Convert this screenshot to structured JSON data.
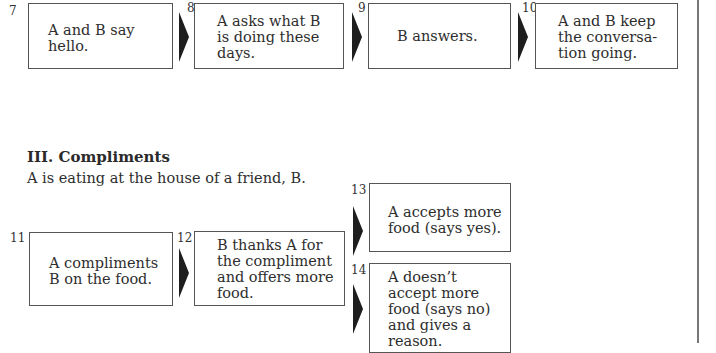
{
  "flow_row_1": {
    "steps": [
      {
        "number": "7",
        "text": "A and B say hello."
      },
      {
        "number": "8",
        "text": "A asks what B is doing these days."
      },
      {
        "number": "9",
        "text": "B answers."
      },
      {
        "number": "10",
        "text": "A and B keep the conversa- tion going."
      }
    ]
  },
  "section": {
    "heading": "III. Compliments",
    "intro": "A is eating at the house of a friend, B."
  },
  "flow_row_2": {
    "steps": [
      {
        "number": "11",
        "text": "A compliments B on the food."
      },
      {
        "number": "12",
        "text": "B thanks A for the compliment and offers more food."
      }
    ],
    "branches": [
      {
        "number": "13",
        "text": "A accepts more food (says yes)."
      },
      {
        "number": "14",
        "text": "A doesn’t accept more food (says no) and gives a reason."
      }
    ]
  },
  "icons": {
    "arrow": "right-pointing-triangle"
  }
}
